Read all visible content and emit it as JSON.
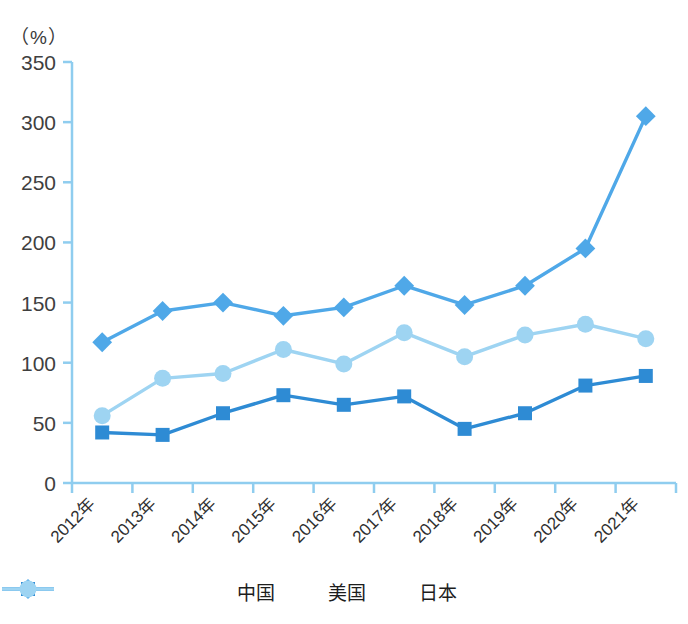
{
  "chart_data": {
    "type": "line",
    "title": "",
    "subtitle": "",
    "unit_label": "（%）",
    "xlabel": "",
    "ylabel": "",
    "ylim": [
      0,
      350
    ],
    "ytick_step": 50,
    "yticks": [
      "0",
      "50",
      "100",
      "150",
      "200",
      "250",
      "300",
      "350"
    ],
    "grid": false,
    "legend_position": "bottom-center",
    "categories": [
      "2012年",
      "2013年",
      "2014年",
      "2015年",
      "2016年",
      "2017年",
      "2018年",
      "2019年",
      "2020年",
      "2021年"
    ],
    "series": [
      {
        "name": "中国",
        "marker": "square",
        "color": "#2E8BD4",
        "values": [
          42,
          40,
          58,
          73,
          65,
          72,
          45,
          58,
          81,
          89
        ]
      },
      {
        "name": "美国",
        "marker": "diamond",
        "color": "#4FA8E8",
        "values": [
          117,
          143,
          150,
          139,
          146,
          164,
          148,
          164,
          195,
          305
        ]
      },
      {
        "name": "日本",
        "marker": "circle",
        "color": "#9ED4F2",
        "values": [
          56,
          87,
          91,
          111,
          99,
          125,
          105,
          123,
          132,
          120
        ]
      }
    ]
  },
  "axis": {
    "line_color": "#8FCDEF",
    "tick_color": "#8FCDEF"
  },
  "legend": {
    "items": [
      {
        "label": "中国"
      },
      {
        "label": "美国"
      },
      {
        "label": "日本"
      }
    ]
  }
}
